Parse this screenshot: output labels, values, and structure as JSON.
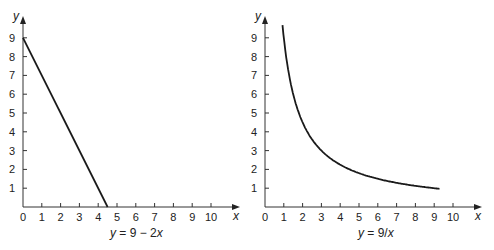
{
  "chart_data": [
    {
      "type": "line",
      "title": "",
      "caption": "y = 9 − 2x",
      "xlabel": "x",
      "ylabel": "y",
      "xlim": [
        0,
        10.6
      ],
      "ylim": [
        0,
        9.8
      ],
      "x_ticks": [
        0,
        1,
        2,
        3,
        4,
        5,
        6,
        7,
        8,
        9,
        10
      ],
      "y_ticks": [
        1,
        2,
        3,
        4,
        5,
        6,
        7,
        8,
        9
      ],
      "grid": false,
      "series": [
        {
          "name": "y = 9 − 2x",
          "x": [
            0,
            4.5
          ],
          "y": [
            9,
            0
          ]
        }
      ]
    },
    {
      "type": "line",
      "title": "",
      "caption": "y = 9/x",
      "xlabel": "x",
      "ylabel": "y",
      "xlim": [
        0,
        10.6
      ],
      "ylim": [
        0,
        9.8
      ],
      "x_ticks": [
        0,
        1,
        2,
        3,
        4,
        5,
        6,
        7,
        8,
        9,
        10
      ],
      "y_ticks": [
        1,
        2,
        3,
        4,
        5,
        6,
        7,
        8,
        9
      ],
      "grid": false,
      "series": [
        {
          "name": "y = 9/x",
          "x": [
            0.93,
            1,
            1.25,
            1.5,
            2,
            2.5,
            3,
            3.5,
            4,
            4.5,
            5,
            6,
            7,
            8,
            9,
            9.3
          ],
          "y": [
            9.7,
            9,
            7.2,
            6,
            4.5,
            3.6,
            3,
            2.57,
            2.25,
            2,
            1.8,
            1.5,
            1.29,
            1.13,
            1,
            0.97
          ]
        }
      ]
    }
  ],
  "left": {
    "caption_y": "y",
    "caption_eq": " = 9 − 2",
    "caption_x": "x",
    "xlabel": "x",
    "ylabel": "y"
  },
  "right": {
    "caption_y": "y",
    "caption_eq": " = 9/",
    "caption_x": "x",
    "xlabel": "x",
    "ylabel": "y"
  },
  "tick_labels": {
    "x": [
      "0",
      "1",
      "2",
      "3",
      "4",
      "5",
      "6",
      "7",
      "8",
      "9",
      "10"
    ],
    "y": [
      "1",
      "2",
      "3",
      "4",
      "5",
      "6",
      "7",
      "8",
      "9"
    ]
  },
  "colors": {
    "line": "#1a1a1a",
    "axis": "#333333",
    "background": "#ffffff"
  }
}
